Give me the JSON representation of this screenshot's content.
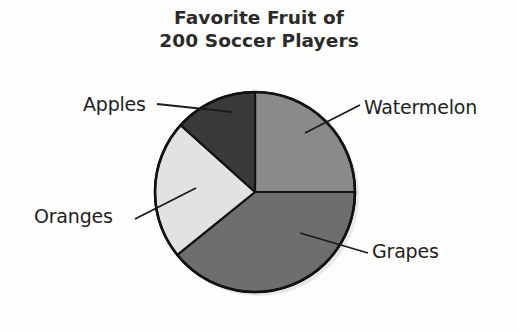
{
  "title": {
    "line1": "Favorite Fruit of",
    "line2": "200 Soccer Players"
  },
  "chart_data": {
    "type": "pie",
    "title": "Favorite Fruit of 200 Soccer Players",
    "subtitle": "",
    "xlabel": "",
    "ylabel": "",
    "total": 200,
    "units": "soccer players",
    "grid": false,
    "legend": "none",
    "label_placement": "outside-with-leader-lines",
    "start_angle_deg": 0,
    "direction": "clockwise",
    "categories": [
      "Watermelon",
      "Grapes",
      "Oranges",
      "Apples"
    ],
    "values": [
      50,
      78,
      45,
      27
    ],
    "percentages": [
      25,
      39,
      22.5,
      13.5
    ],
    "slices": [
      {
        "label": "Watermelon",
        "value": 50,
        "percent": 25,
        "start_deg": 0,
        "end_deg": 90,
        "sweep_deg": 90,
        "color": "#8a8a8a"
      },
      {
        "label": "Grapes",
        "value": 78,
        "percent": 39,
        "start_deg": 90,
        "end_deg": 231,
        "sweep_deg": 141,
        "color": "#6e6e6e"
      },
      {
        "label": "Oranges",
        "value": 45,
        "percent": 22.5,
        "start_deg": 231,
        "end_deg": 312,
        "sweep_deg": 81,
        "color": "#e2e2e0"
      },
      {
        "label": "Apples",
        "value": 27,
        "percent": 13.5,
        "start_deg": 312,
        "end_deg": 360,
        "sweep_deg": 48,
        "color": "#3a3a3a"
      }
    ],
    "colors": {
      "watermelon": "#8a8a8a",
      "grapes": "#6e6e6e",
      "oranges": "#e2e2e0",
      "apples": "#3a3a3a",
      "outline": "#111111",
      "text": "#1f1f1f",
      "title": "#2b2b2b",
      "background": "#fdfdfc"
    }
  },
  "labels": {
    "apples": "Apples",
    "watermelon": "Watermelon",
    "oranges": "Oranges",
    "grapes": "Grapes"
  }
}
